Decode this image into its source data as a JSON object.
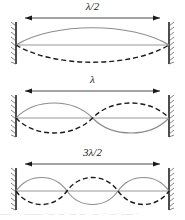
{
  "figure": {
    "colors": {
      "solid_wave": "#8c8c8c",
      "dashed_wave": "#1a1a1a",
      "axis": "#8c8c8c",
      "wall": "#4d4d4d",
      "dimension_line": "#1a1a1a",
      "background": "#ffffff"
    },
    "panels": [
      {
        "id": "first-harmonic",
        "label": "λ/2",
        "lobes": 1,
        "harmonic": 1,
        "nodes": 2,
        "antinodes": 1
      },
      {
        "id": "second-harmonic",
        "label": "λ",
        "lobes": 2,
        "harmonic": 2,
        "nodes": 3,
        "antinodes": 2
      },
      {
        "id": "third-harmonic",
        "label": "3λ/2",
        "lobes": 3,
        "harmonic": 3,
        "nodes": 4,
        "antinodes": 3
      }
    ],
    "caption": "——  ·   · ·    ——— ··—··—  · —· —· · — · ·· —·· —— ··"
  }
}
